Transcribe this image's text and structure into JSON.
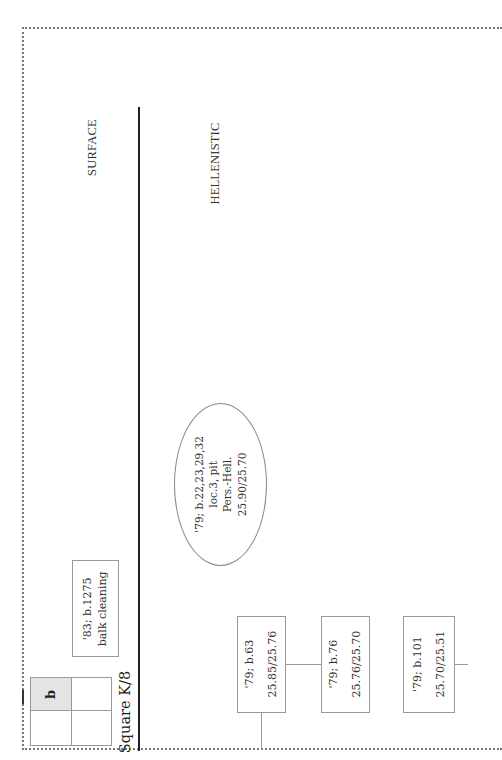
{
  "diagram": {
    "orientation": "rotated-90-ccw",
    "phases": [
      {
        "id": "surface",
        "label": "SURFACE"
      },
      {
        "id": "hellenistic",
        "label": "HELLENISTIC"
      }
    ],
    "square": {
      "label": "Square K/8",
      "quadrants": [
        {
          "position": "top-left",
          "label": "b",
          "highlighted": true
        },
        {
          "position": "top-right",
          "label": "",
          "highlighted": false
        },
        {
          "position": "bottom-left",
          "label": "",
          "highlighted": false
        },
        {
          "position": "bottom-right",
          "label": "",
          "highlighted": false
        }
      ],
      "highlight_color": "#e4e4e4"
    },
    "nodes": [
      {
        "id": "b1275",
        "shape": "rect",
        "lines": [
          "'83; b.1275",
          "balk cleaning"
        ]
      },
      {
        "id": "b22",
        "shape": "ellipse",
        "lines": [
          "'79; b.22,23,29,32",
          "loc.3, pit",
          "Pers.-Hell.",
          "25.90/25.70"
        ]
      },
      {
        "id": "b63",
        "shape": "rect",
        "lines": [
          "'79; b.63",
          "25.85/25.76"
        ]
      },
      {
        "id": "b76",
        "shape": "rect",
        "lines": [
          "'79; b.76",
          "25.76/25.70"
        ]
      },
      {
        "id": "b101",
        "shape": "rect",
        "lines": [
          "'79; b.101",
          "25.70/25.51"
        ]
      }
    ],
    "edges": [
      {
        "from": "b63",
        "to": "b76"
      },
      {
        "from": "b101",
        "to": "offscreen-right"
      },
      {
        "from": "b63",
        "to": "baseline"
      }
    ]
  }
}
